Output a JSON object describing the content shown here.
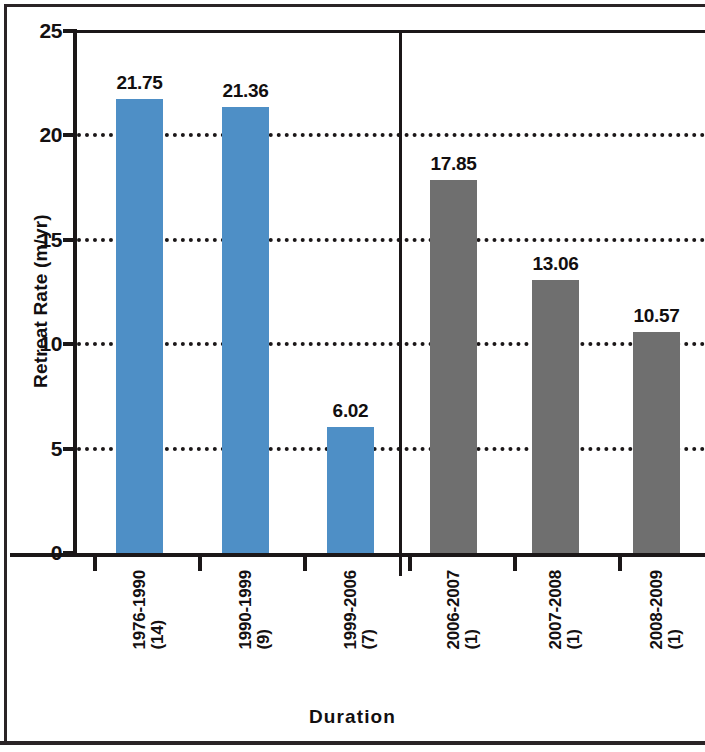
{
  "chart_data": {
    "type": "bar",
    "title": "",
    "xlabel": "Duration",
    "ylabel": "Retreat Rate (m/yr)",
    "ylim": [
      0,
      25
    ],
    "yticks": [
      0,
      5,
      10,
      15,
      20,
      25
    ],
    "ytick_labels": [
      "0",
      "5",
      "10",
      "15",
      "20",
      "25"
    ],
    "grid": "horizontal dotted gridlines at 5, 10, 15, 20",
    "legend": "none",
    "categories": [
      "1976-1990 (14)",
      "1990-1999 (9)",
      "1999-2006 (7)",
      "2006-2007 (1)",
      "2007-2008 (1)",
      "2008-2009 (1)"
    ],
    "category_periods": [
      "1976-1990",
      "1990-1999",
      "1999-2006",
      "2006-2007",
      "2007-2008",
      "2008-2009"
    ],
    "category_counts": [
      "(14)",
      "(9)",
      "(7)",
      "(1)",
      "(1)",
      "(1)"
    ],
    "values": [
      21.75,
      21.36,
      6.02,
      17.85,
      13.06,
      10.57
    ],
    "value_labels": [
      "21.75",
      "21.36",
      "6.02",
      "17.85",
      "13.06",
      "10.57"
    ],
    "bar_colors": [
      "#4e8fc6",
      "#4e8fc6",
      "#4e8fc6",
      "#6f6f6f",
      "#6f6f6f",
      "#6f6f6f"
    ],
    "groups": [
      {
        "name": "multi-year intervals",
        "color": "#4e8fc6",
        "categories": [
          "1976-1990 (14)",
          "1990-1999 (9)",
          "1999-2006 (7)"
        ]
      },
      {
        "name": "annual intervals",
        "color": "#6f6f6f",
        "categories": [
          "2006-2007 (1)",
          "2007-2008 (1)",
          "2008-2009 (1)"
        ]
      }
    ],
    "group_separator_after_category_index": 2,
    "annotations": []
  },
  "colors": {
    "blue": "#4e8fc6",
    "grey": "#6f6f6f",
    "axis": "#1b1718",
    "frame": "#2a2426",
    "background": "#ffffff"
  }
}
